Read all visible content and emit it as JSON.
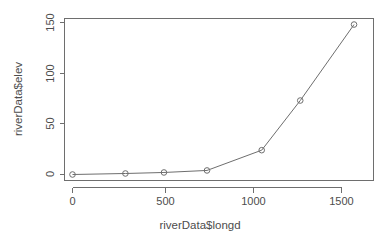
{
  "chart_data": {
    "type": "line",
    "title": "",
    "subtitle": "",
    "xlabel": "riverData$longd",
    "ylabel": "riverData$elev",
    "xlim": [
      -78,
      1672
    ],
    "ylim": [
      -6,
      156
    ],
    "xticks": [
      0,
      500,
      1000,
      1500
    ],
    "xtick_labels": [
      "0",
      "500",
      "1000",
      "1500"
    ],
    "yticks": [
      0,
      50,
      100,
      150
    ],
    "ytick_labels": [
      "0",
      "50",
      "100",
      "150"
    ],
    "grid": false,
    "legend": "none",
    "marker": "open-circle",
    "line_color": "#6e6e6e",
    "x": [
      0,
      295,
      510,
      750,
      1055,
      1270,
      1570
    ],
    "y": [
      0,
      1,
      2,
      4,
      24,
      73,
      148
    ],
    "points": [
      {
        "x": 0,
        "y": 0
      },
      {
        "x": 295,
        "y": 1
      },
      {
        "x": 510,
        "y": 2
      },
      {
        "x": 750,
        "y": 4
      },
      {
        "x": 1055,
        "y": 24
      },
      {
        "x": 1270,
        "y": 73
      },
      {
        "x": 1570,
        "y": 148
      }
    ]
  },
  "axes": {
    "x_title": "riverData$longd",
    "y_title": "riverData$elev",
    "x_tick_0": "0",
    "x_tick_1": "500",
    "x_tick_2": "1000",
    "x_tick_3": "1500",
    "y_tick_0": "0",
    "y_tick_1": "50",
    "y_tick_2": "100",
    "y_tick_3": "150"
  }
}
